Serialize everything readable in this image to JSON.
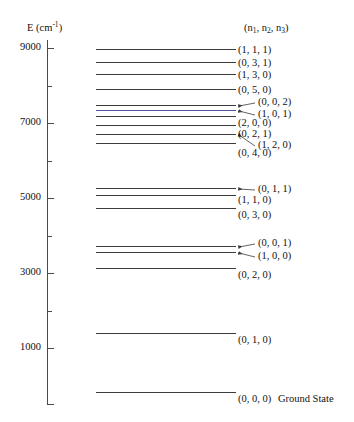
{
  "figure": {
    "yaxis_title_main": "E (cm",
    "yaxis_title_sup": "-1",
    "yaxis_title_close": ")",
    "column_header_open": "(n",
    "column_header_sub1": "1",
    "column_header_mid1": ", n",
    "column_header_sub2": "2",
    "column_header_mid2": ", n",
    "column_header_sub3": "3",
    "column_header_close": ")",
    "ground_state_suffix": "Ground State"
  },
  "axis": {
    "major_ticks": [
      {
        "value": 9000,
        "label": "9000"
      },
      {
        "value": 7000,
        "label": "7000"
      },
      {
        "value": 5000,
        "label": "5000"
      },
      {
        "value": 3000,
        "label": "3000"
      },
      {
        "value": 1000,
        "label": "1000"
      }
    ],
    "minor_ticks": [
      8000,
      6000,
      4000,
      2000
    ],
    "range": [
      -200,
      9400
    ]
  },
  "chart_data": {
    "type": "line",
    "title": "",
    "xlabel": "",
    "ylabel": "E (cm^-1)",
    "ylim": [
      -200,
      9400
    ],
    "grid": false,
    "legend": "none",
    "categories": [
      "(1, 1, 1)",
      "(0, 3, 1)",
      "(1, 3, 0)",
      "(0, 5, 0)",
      "(0, 0, 2)",
      "(1, 0, 1)",
      "(2, 0, 0)",
      "(0, 2, 1)",
      "(1, 2, 0)",
      "(0, 4, 0)",
      "(0, 1, 1)",
      "(1, 1, 0)",
      "(0, 3, 0)",
      "(0, 0, 1)",
      "(1, 0, 0)",
      "(0, 2, 0)",
      "(0, 1, 0)",
      "(0, 0, 0)"
    ],
    "values": [
      8800,
      8460,
      8300,
      7910,
      7470,
      7400,
      7210,
      7050,
      6910,
      6760,
      5450,
      5340,
      5090,
      3760,
      3660,
      3400,
      1590,
      0
    ],
    "series": [
      {
        "name": "vibrational energy levels",
        "values": [
          8800,
          8460,
          8300,
          7910,
          7470,
          7400,
          7210,
          7050,
          6910,
          6760,
          5450,
          5340,
          5090,
          3760,
          3660,
          3400,
          1590,
          0
        ]
      }
    ]
  },
  "levels": [
    {
      "label": "(1, 1, 1)",
      "energy": 8800,
      "y": 49,
      "leader": false,
      "label_x": 238,
      "label_y": 44
    },
    {
      "label": "(0, 3, 1)",
      "energy": 8460,
      "y": 62,
      "leader": false,
      "label_x": 238,
      "label_y": 57
    },
    {
      "label": "(1, 3, 0)",
      "energy": 8300,
      "y": 74,
      "leader": false,
      "label_x": 238,
      "label_y": 69
    },
    {
      "label": "(0, 5, 0)",
      "energy": 7910,
      "y": 89,
      "leader": false,
      "label_x": 238,
      "label_y": 84
    },
    {
      "label": "(0, 0, 2)",
      "energy": 7470,
      "y": 105,
      "leader": true,
      "label_x": 258,
      "label_y": 96
    },
    {
      "label": "(1, 0, 1)",
      "energy": 7400,
      "y": 110,
      "leader": true,
      "label_x": 258,
      "label_y": 108
    },
    {
      "label": "(2, 0, 0)",
      "energy": 7210,
      "y": 116,
      "leader": false,
      "label_x": 238,
      "label_y": 117
    },
    {
      "label": "(0, 2, 1)",
      "energy": 7050,
      "y": 125,
      "leader": false,
      "label_x": 238,
      "label_y": 128
    },
    {
      "label": "(1, 2, 0)",
      "energy": 6910,
      "y": 134,
      "leader": true,
      "label_x": 258,
      "label_y": 139
    },
    {
      "label": "(0, 4, 0)",
      "energy": 6760,
      "y": 143,
      "leader": false,
      "label_x": 238,
      "label_y": 147
    },
    {
      "label": "(0, 1, 1)",
      "energy": 5450,
      "y": 188,
      "leader": true,
      "label_x": 258,
      "label_y": 183
    },
    {
      "label": "(1, 1, 0)",
      "energy": 5340,
      "y": 195,
      "leader": false,
      "label_x": 238,
      "label_y": 194
    },
    {
      "label": "(0, 3, 0)",
      "energy": 5090,
      "y": 208,
      "leader": false,
      "label_x": 238,
      "label_y": 209
    },
    {
      "label": "(0, 0, 1)",
      "energy": 3760,
      "y": 246,
      "leader": true,
      "label_x": 258,
      "label_y": 237
    },
    {
      "label": "(1, 0, 0)",
      "energy": 3660,
      "y": 252,
      "leader": true,
      "label_x": 258,
      "label_y": 250
    },
    {
      "label": "(0, 2, 0)",
      "energy": 3400,
      "y": 268,
      "leader": false,
      "label_x": 238,
      "label_y": 269
    },
    {
      "label": "(0, 1, 0)",
      "energy": 1590,
      "y": 333,
      "leader": false,
      "label_x": 238,
      "label_y": 334
    },
    {
      "label": "(0, 0, 0)",
      "energy": 0,
      "y": 392,
      "leader": false,
      "label_x": 238,
      "label_y": 393
    }
  ],
  "colors": {
    "line": "#3c3c3c",
    "axis": "#4a4a4a",
    "text": "#111111",
    "accent_blue": "#55559b",
    "background": "#ffffff"
  }
}
